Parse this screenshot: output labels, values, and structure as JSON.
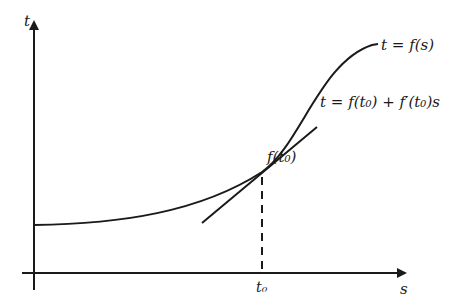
{
  "figure": {
    "axes": {
      "y_label": "t",
      "x_label": "s",
      "x_tick_label": "t₀"
    },
    "curve": {
      "label": "t = f(s)",
      "description": "S-shaped curve"
    },
    "tangent": {
      "label": "t = f(t₀) + f′(t₀)s"
    },
    "point": {
      "label": "f(t₀)"
    },
    "colors": {
      "ink": "#1a1a1a",
      "background": "#ffffff"
    }
  }
}
